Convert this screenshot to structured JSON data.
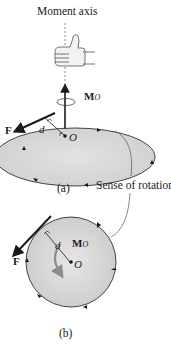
{
  "diagram": {
    "title_label": "Moment axis",
    "sense_label": "Sense of rotation",
    "figure_a": {
      "caption": "(a)",
      "force_label": "F",
      "distance_label": "d",
      "point_label": "O",
      "moment_label": "M",
      "moment_subscript": "O"
    },
    "figure_b": {
      "caption": "(b)",
      "force_label": "F",
      "distance_label": "d",
      "point_label": "O",
      "moment_label": "M",
      "moment_subscript": "O"
    },
    "colors": {
      "disk_fill": "#d9d9d9",
      "line": "#1a1a1a",
      "curl_arrow": "#8c8c8c"
    }
  }
}
